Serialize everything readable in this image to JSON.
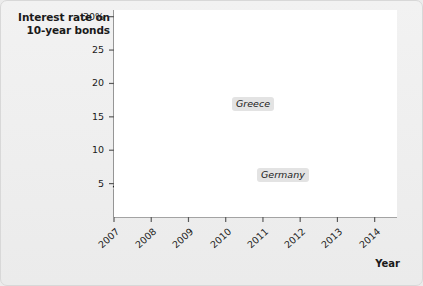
{
  "chart_data": {
    "type": "line",
    "title": "Interest rate on 10-year bonds",
    "xlabel": "Year",
    "ylabel": "",
    "xlim": [
      2007,
      2014.6
    ],
    "ylim": [
      0,
      31
    ],
    "grid": false,
    "legend_position": "inline-annotations",
    "y_ticks": [
      "5",
      "10",
      "15",
      "20",
      "25",
      "30%"
    ],
    "y_tick_values": [
      5,
      10,
      15,
      20,
      25,
      30
    ],
    "x_ticks": [
      "2007",
      "2008",
      "2009",
      "2010",
      "2011",
      "2012",
      "2013",
      "2014"
    ],
    "x_tick_values": [
      2007,
      2008,
      2009,
      2010,
      2011,
      2012,
      2013,
      2014
    ],
    "series": [
      {
        "name": "Greece",
        "color": "#1f1f1f",
        "x": [
          2007.0,
          2007.25,
          2007.5,
          2007.75,
          2008.0,
          2008.25,
          2008.5,
          2008.75,
          2009.0,
          2009.2,
          2009.4,
          2009.6,
          2009.8,
          2010.0,
          2010.2,
          2010.4,
          2010.6,
          2010.8,
          2011.0,
          2011.2,
          2011.4,
          2011.6,
          2011.8,
          2012.0,
          2012.15,
          2012.3,
          2012.5,
          2012.7,
          2012.9,
          2013.0,
          2013.2,
          2013.5,
          2013.8,
          2014.0,
          2014.3,
          2014.5
        ],
        "y": [
          4.5,
          4.7,
          4.7,
          4.7,
          4.6,
          4.6,
          4.8,
          4.7,
          5.0,
          6.0,
          5.3,
          5.2,
          5.4,
          6.0,
          7.2,
          9.0,
          10.8,
          12.2,
          12.4,
          15.8,
          16.4,
          18.0,
          21.0,
          24.0,
          25.2,
          25.0,
          20.5,
          16.0,
          12.0,
          11.2,
          11.2,
          10.0,
          8.6,
          7.6,
          6.4,
          6.3
        ]
      },
      {
        "name": "Germany",
        "color": "#bdbdbd",
        "x": [
          2007.0,
          2007.3,
          2007.6,
          2008.0,
          2008.3,
          2008.6,
          2009.0,
          2009.3,
          2009.6,
          2010.0,
          2010.3,
          2010.6,
          2011.0,
          2011.3,
          2011.6,
          2012.0,
          2012.3,
          2012.6,
          2013.0,
          2013.3,
          2013.6,
          2014.0,
          2014.3,
          2014.5
        ],
        "y": [
          4.3,
          4.3,
          4.3,
          4.1,
          4.2,
          4.1,
          3.7,
          3.4,
          3.4,
          3.3,
          3.2,
          3.0,
          3.2,
          3.1,
          2.8,
          2.6,
          2.2,
          1.8,
          1.7,
          1.8,
          1.8,
          1.7,
          1.4,
          1.3
        ]
      }
    ],
    "annotations": [
      {
        "label": "Greece",
        "target_x": 2011.25,
        "target_y": 15.9
      },
      {
        "label": "Germany",
        "target_x": 2012.55,
        "target_y": 2.0
      }
    ]
  }
}
